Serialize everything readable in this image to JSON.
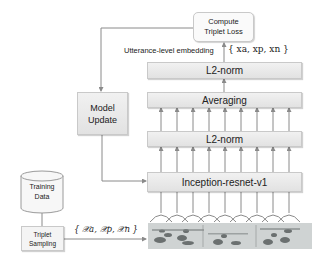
{
  "diagram": {
    "compute_loss": {
      "line1": "Compute",
      "line2": "Triplet Loss"
    },
    "embedding_label": "Utterance-level embedding",
    "embedding_math": "{ xa, xp, xn }",
    "layers": {
      "top_l2norm": "L2-norm",
      "averaging": "Averaging",
      "mid_l2norm": "L2-norm",
      "backbone": "Inception-resnet-v1"
    },
    "model_update": {
      "line1": "Model",
      "line2": "Update"
    },
    "training_data": {
      "line1": "Training",
      "line2": "Data"
    },
    "triplet_sampling": {
      "line1": "Triplet",
      "line2": "Sampling"
    },
    "sampling_math": "{ 𝒳a, 𝒳p, 𝒳n }",
    "input": "spectrogram",
    "colors": {
      "box_fill": "#e8e8e8",
      "box_border": "#c9c9c9",
      "line": "#8a8a8a",
      "spectrogram_bg": "#cfd3d3"
    }
  }
}
